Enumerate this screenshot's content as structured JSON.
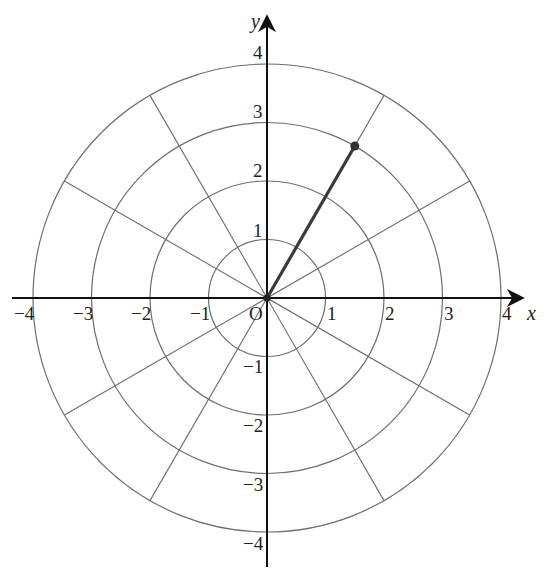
{
  "diagram": {
    "type": "polar-coordinate-grid",
    "origin_label": "O",
    "x_axis_label": "x",
    "y_axis_label": "y",
    "x_tick_labels": [
      "−4",
      "−3",
      "−2",
      "−1",
      "1",
      "2",
      "3",
      "4"
    ],
    "y_tick_labels": [
      "4",
      "3",
      "2",
      "1",
      "−1",
      "−2",
      "−3",
      "−4"
    ],
    "circle_radii": [
      1,
      2,
      3,
      4
    ],
    "radial_line_step_degrees": 30,
    "point": {
      "r": 3,
      "theta_degrees": 60
    },
    "colors": {
      "grid": "#6e6e6e",
      "axis": "#111111",
      "vector": "#3a3a3a",
      "background": "#ffffff"
    }
  }
}
